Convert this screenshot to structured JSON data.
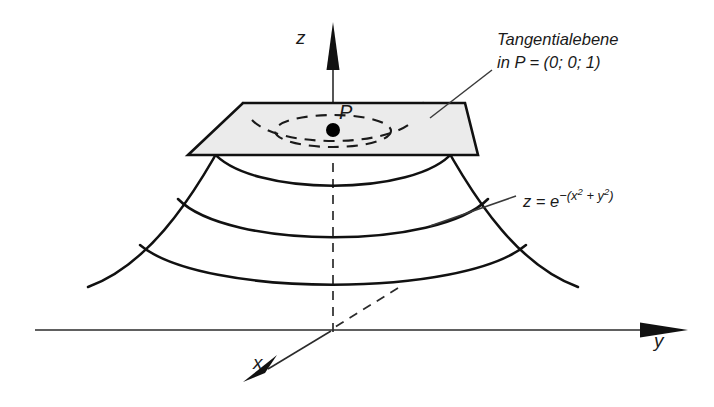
{
  "figure": {
    "background_color": "#ffffff",
    "ink_color": "#111111",
    "plane_fill_color": "#ebebeb"
  },
  "axes": {
    "z_label": "z",
    "y_label": "y",
    "x_label": "x",
    "origin": {
      "x": 333,
      "y": 330
    },
    "z_axis": {
      "from_x": 333,
      "from_y": 330,
      "to_x": 333,
      "to_y": 22,
      "visible_from_y": 155,
      "dashed_below_point": true
    },
    "y_axis": {
      "from_x": 35,
      "from_y": 330,
      "to_x": 688,
      "to_y": 330
    },
    "x_axis": {
      "from_x": 398,
      "from_y": 288,
      "to_x": 243,
      "to_y": 382,
      "dashed_behind": true
    }
  },
  "point": {
    "name": "P",
    "label": "P",
    "coordinates": "(0; 0; 1)",
    "x": 333,
    "y": 130,
    "radius": 7
  },
  "tangent_plane": {
    "annotation_line_1": "Tangentialebene",
    "annotation_line_2": "in P = (0; 0; 1)",
    "corners": [
      [
        243,
        103
      ],
      [
        465,
        103
      ],
      [
        478,
        155
      ],
      [
        188,
        155
      ]
    ],
    "leader": {
      "from_x": 492,
      "from_y": 70,
      "to_x": 430,
      "to_y": 118
    }
  },
  "surface": {
    "equation_text": "z = e^-(x^2 + y^2)",
    "equation_parts": {
      "z": "z",
      "equals": "=",
      "base": "e",
      "exponent_sign": "−(",
      "x": "x",
      "x_power": "2",
      "plus": "+",
      "y": "y",
      "y_power": "2",
      "close": ")"
    },
    "leader": {
      "from_x": 516,
      "from_y": 196,
      "to_x": 430,
      "to_y": 226
    },
    "hidden_rim_ellipse": {
      "cx": 333,
      "cy": 131,
      "rx": 58,
      "ry": 16
    },
    "profile_left": "M 88 287 C 140 268 188 215 243 103",
    "profile_right": "M 578 287 C 526 268 478 215 423 103",
    "contours": [
      {
        "level": 1,
        "d": "M 243 104 C 270 143 396 143 423 104"
      },
      {
        "level": 2,
        "d": "M 213 152 C 250 197 416 197 453 152"
      },
      {
        "level": 3,
        "d": "M 178 199 C 228 250 438 250 488 199"
      },
      {
        "level": 4,
        "d": "M 140 245 C 203 298 463 298 526 245"
      }
    ],
    "rim_occluded_segment": {
      "d": "M 252 120 C 278 148 388 148 414 120"
    }
  }
}
